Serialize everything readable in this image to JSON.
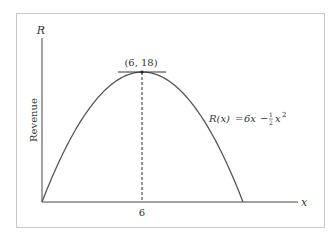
{
  "figure": {
    "y_axis_label": "R",
    "x_axis_label": "x",
    "y_axis_title": "Revenue",
    "vertex_label": "(6, 18)",
    "x_tick_label": "6",
    "function_label": {
      "lhs": "R(x)",
      "equals": "=",
      "rhs_term1": "6x",
      "minus": "−",
      "frac_num": "1",
      "frac_den": "2",
      "rhs_var": "x",
      "exponent": "2"
    }
  },
  "chart_data": {
    "type": "line",
    "title": "",
    "xlabel": "x",
    "ylabel": "Revenue (R)",
    "function": "R(x) = 6x - (1/2)x^2",
    "x": [
      0,
      1,
      2,
      3,
      4,
      5,
      6,
      7,
      8,
      9,
      10,
      11,
      12
    ],
    "values": [
      0,
      5.5,
      10,
      13.5,
      16,
      17.5,
      18,
      17.5,
      16,
      13.5,
      10,
      5.5,
      0
    ],
    "annotations": [
      {
        "type": "point",
        "x": 6,
        "y": 18,
        "label": "(6, 18)"
      },
      {
        "type": "tangent_line",
        "at_x": 6,
        "slope": 0
      },
      {
        "type": "dashed_vertical",
        "x": 6
      }
    ],
    "x_ticks": [
      6
    ],
    "xlim": [
      0,
      14
    ],
    "ylim": [
      0,
      26
    ],
    "grid": false,
    "legend": "none"
  },
  "colors": {
    "curve": "#555555",
    "axes": "#444444",
    "frame": "#c8c8c8",
    "text": "#333333"
  }
}
